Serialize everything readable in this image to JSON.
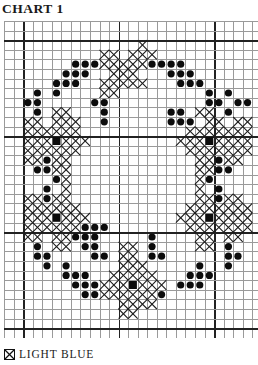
{
  "title": "CHART 1",
  "grid": {
    "cols": 27,
    "rows": 33,
    "cell_w": 9.55,
    "cell_h": 9.6,
    "thick_every": 10,
    "thick_offset_col": 2,
    "thick_offset_row": 2
  },
  "legend": [
    {
      "symbol": "cross-icon",
      "label": "LIGHT BLUE"
    }
  ],
  "symbols": {
    "X": "light-blue-cross",
    "o": "dark-dot",
    "#": "dark-square"
  },
  "pattern": [
    "...........................",
    "...........................",
    "..............X............",
    "..........XX.XXX...........",
    ".......oooXXXXXoooo........",
    "......ooo..XXX...ooo.......",
    ".....ooo..XXXXX...ooo......",
    "...o.o....XX.........o.o...",
    "..oo.....oo..........oo.oo.",
    "...o.XX...o......oo.XX.o...",
    "..XX.XXX..o......ooo.XX.XX.",
    "..XXXXXX...........XXXXXXX.",
    "..XXX#XXX.........XXX#XXXX.",
    "..XXXXXX...........XXXXXXX.",
    "..XXoXX.............XXoXX..",
    "...ooXX.............XXoo...",
    ".....oX.............Xo.....",
    "....o.X.............X.o....",
    "..XXoXX.............XXoXX..",
    "..XXXXXX...........XXXXXXX.",
    "..XXX#XXX.........XXX#XXXX.",
    "..XXXXXXooo........XXXXXXX.",
    "..XX.XXooo.....o....XX.XX..",
    "...o.XX.oo..XX.o....XX.o...",
    "...oo....oo.XX.oo......oo..",
    "....o.o.....XXX.....o..o...",
    "......ooo..XXXXX...ooo.....",
    ".......oooXXX#XXX.ooo......",
    "........ooXXXXXXo..........",
    "............XXXX...........",
    "............XX.............",
    "...........................",
    "..........................."
  ]
}
